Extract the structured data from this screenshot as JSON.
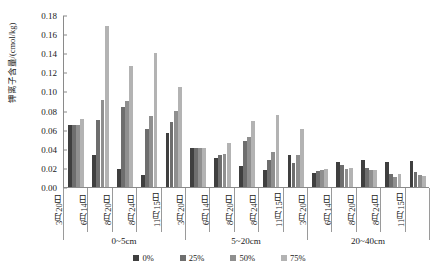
{
  "chart_data": {
    "type": "bar",
    "title": "",
    "xlabel": "",
    "ylabel": "钾离子含量/(cmol/kg)",
    "ylim": [
      0.0,
      0.18
    ],
    "ytick_labels": [
      "0.18",
      "0.16",
      "0.14",
      "0.12",
      "0.10",
      "0.08",
      "0.06",
      "0.04",
      "0.02",
      "0.00"
    ],
    "ytick_values": [
      0.18,
      0.16,
      0.14,
      0.12,
      0.1,
      0.08,
      0.06,
      0.04,
      0.02,
      0.0
    ],
    "grid": false,
    "legend_position": "bottom",
    "categories": [
      "3月20日",
      "6月14日",
      "8月20日",
      "8月24日",
      "11月15日",
      "3月20日",
      "6月14日",
      "8月20日",
      "8月24日",
      "11月15日",
      "3月20日",
      "6月14日",
      "8月20日",
      "8月24日",
      "11月15日"
    ],
    "groups": [
      {
        "label": "0~5cm",
        "start": 0,
        "count": 5
      },
      {
        "label": "5~20cm",
        "start": 5,
        "count": 5
      },
      {
        "label": "20~40cm",
        "start": 10,
        "count": 5
      }
    ],
    "series": [
      {
        "name": "0%",
        "color": "#3f3f3f",
        "values": [
          0.065,
          0.034,
          0.019,
          0.013,
          0.057,
          0.041,
          0.03,
          0.022,
          0.018,
          0.033,
          0.015,
          0.026,
          0.028,
          0.026,
          0.027
        ]
      },
      {
        "name": "25%",
        "color": "#6e6e6e",
        "values": [
          0.065,
          0.07,
          0.084,
          0.061,
          0.068,
          0.041,
          0.034,
          0.048,
          0.028,
          0.025,
          0.017,
          0.023,
          0.02,
          0.014,
          0.016
        ]
      },
      {
        "name": "50%",
        "color": "#8f8f8f",
        "values": [
          0.065,
          0.091,
          0.09,
          0.074,
          0.08,
          0.041,
          0.035,
          0.052,
          0.037,
          0.033,
          0.018,
          0.019,
          0.018,
          0.011,
          0.013
        ]
      },
      {
        "name": "75%",
        "color": "#b3b3b3",
        "values": [
          0.071,
          0.168,
          0.127,
          0.14,
          0.105,
          0.041,
          0.046,
          0.069,
          0.075,
          0.061,
          0.019,
          0.02,
          0.018,
          0.014,
          0.012
        ]
      }
    ]
  }
}
